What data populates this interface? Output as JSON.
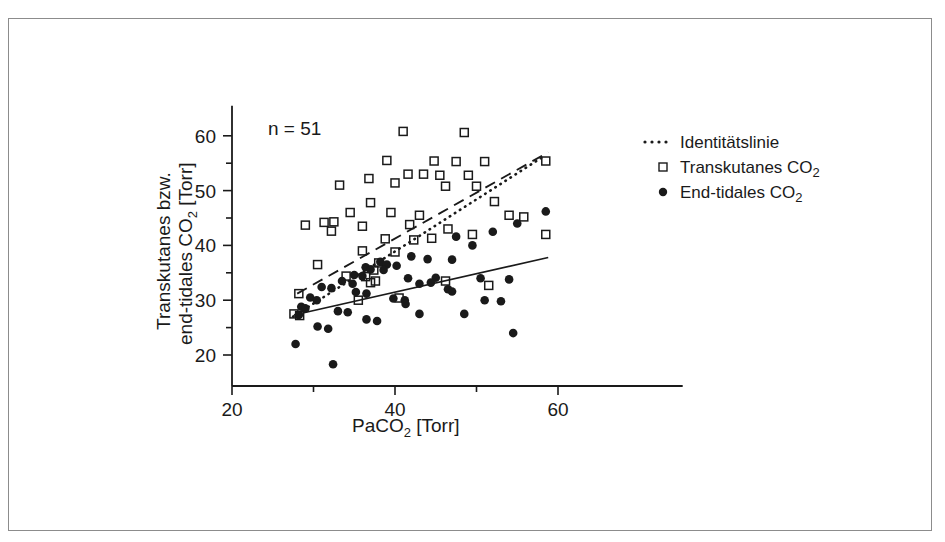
{
  "figure": {
    "frame_color": "#8c8c8c",
    "background": "#ffffff",
    "ink_color": "#1a1a1a"
  },
  "annotation": {
    "sample_size": "n = 51"
  },
  "axis_titles": {
    "x_main": "PaCO",
    "x_sub": "2",
    "x_unit": " [Torr]",
    "y_line1": "Transkutanes bzw.",
    "y_line2_main": "end-tidales CO",
    "y_line2_sub": "2",
    "y_line2_unit": " [Torr]"
  },
  "legend": {
    "items": [
      {
        "label": "Identitätslinie",
        "marker": "dotted-line-icon"
      },
      {
        "label_main": "Transkutanes CO",
        "label_sub": "2",
        "marker": "open-square-icon"
      },
      {
        "label_main": "End-tidales CO",
        "label_sub": "2",
        "marker": "filled-circle-icon"
      }
    ]
  },
  "chart_data": {
    "type": "scatter",
    "title": "",
    "xlabel": "PaCO2 [Torr]",
    "ylabel": "Transkutanes bzw. end-tidales CO2 [Torr]",
    "xlim": [
      20,
      75.3
    ],
    "ylim": [
      15.5,
      65.5
    ],
    "xticks": [
      20,
      30,
      40,
      50,
      60
    ],
    "xticklabels": [
      "20",
      "",
      "40",
      "",
      "60"
    ],
    "yticks": [
      20,
      25,
      30,
      35,
      40,
      45,
      50,
      55,
      60
    ],
    "yticklabels": [
      "20",
      "",
      "30",
      "",
      "40",
      "",
      "50",
      "",
      "60"
    ],
    "grid": false,
    "legend_position": "right",
    "annotations": [
      {
        "text": "n = 51",
        "x": 28.5,
        "y": 61.5
      }
    ],
    "series": [
      {
        "name": "Transkutanes CO2",
        "marker": "open-square",
        "points": [
          [
            41.0,
            60.8
          ],
          [
            48.5,
            60.6
          ],
          [
            39.0,
            55.5
          ],
          [
            44.8,
            55.4
          ],
          [
            47.5,
            55.3
          ],
          [
            51.0,
            55.3
          ],
          [
            58.5,
            55.4
          ],
          [
            36.8,
            52.2
          ],
          [
            41.6,
            53.0
          ],
          [
            43.5,
            53.0
          ],
          [
            45.5,
            52.8
          ],
          [
            49.0,
            52.8
          ],
          [
            33.2,
            51.0
          ],
          [
            40.0,
            51.4
          ],
          [
            46.2,
            50.8
          ],
          [
            50.0,
            50.8
          ],
          [
            37.0,
            47.8
          ],
          [
            52.2,
            48.0
          ],
          [
            34.5,
            46.0
          ],
          [
            39.5,
            46.0
          ],
          [
            43.0,
            45.5
          ],
          [
            54.0,
            45.5
          ],
          [
            55.8,
            45.2
          ],
          [
            29.0,
            43.7
          ],
          [
            31.3,
            44.2
          ],
          [
            32.5,
            44.3
          ],
          [
            36.0,
            43.5
          ],
          [
            41.8,
            43.8
          ],
          [
            32.2,
            42.6
          ],
          [
            46.5,
            43.0
          ],
          [
            49.5,
            42.0
          ],
          [
            58.5,
            42.0
          ],
          [
            38.8,
            41.2
          ],
          [
            42.3,
            41.0
          ],
          [
            44.5,
            41.3
          ],
          [
            36.0,
            39.0
          ],
          [
            40.0,
            38.8
          ],
          [
            30.5,
            36.5
          ],
          [
            38.0,
            36.8
          ],
          [
            37.4,
            35.5
          ],
          [
            34.0,
            34.4
          ],
          [
            36.4,
            34.3
          ],
          [
            37.0,
            33.2
          ],
          [
            37.6,
            33.5
          ],
          [
            46.2,
            33.5
          ],
          [
            51.5,
            32.7
          ],
          [
            28.2,
            31.2
          ],
          [
            27.6,
            27.5
          ],
          [
            28.3,
            27.2
          ],
          [
            35.5,
            30.0
          ],
          [
            40.5,
            30.4
          ]
        ]
      },
      {
        "name": "End-tidales CO2",
        "marker": "filled-circle",
        "points": [
          [
            58.5,
            46.2
          ],
          [
            55.0,
            44.0
          ],
          [
            52.0,
            42.5
          ],
          [
            47.5,
            41.6
          ],
          [
            49.5,
            40.0
          ],
          [
            42.0,
            38.0
          ],
          [
            44.0,
            37.5
          ],
          [
            47.0,
            37.4
          ],
          [
            38.2,
            37.0
          ],
          [
            39.0,
            36.5
          ],
          [
            40.2,
            36.3
          ],
          [
            36.4,
            36.0
          ],
          [
            37.0,
            35.6
          ],
          [
            38.6,
            35.5
          ],
          [
            35.0,
            34.6
          ],
          [
            36.0,
            34.4
          ],
          [
            41.6,
            34.0
          ],
          [
            45.0,
            34.1
          ],
          [
            50.5,
            34.0
          ],
          [
            54.0,
            33.8
          ],
          [
            33.5,
            33.5
          ],
          [
            34.8,
            33.0
          ],
          [
            43.0,
            33.0
          ],
          [
            44.4,
            33.2
          ],
          [
            31.0,
            32.4
          ],
          [
            32.2,
            32.2
          ],
          [
            46.5,
            32.0
          ],
          [
            47.0,
            31.6
          ],
          [
            35.2,
            31.5
          ],
          [
            36.5,
            31.2
          ],
          [
            29.6,
            30.5
          ],
          [
            30.4,
            30.0
          ],
          [
            39.8,
            30.3
          ],
          [
            41.2,
            30.0
          ],
          [
            41.3,
            29.3
          ],
          [
            51.0,
            30.0
          ],
          [
            53.0,
            29.8
          ],
          [
            28.5,
            28.8
          ],
          [
            29.0,
            28.5
          ],
          [
            28.2,
            27.3
          ],
          [
            33.0,
            28.0
          ],
          [
            34.2,
            27.8
          ],
          [
            43.0,
            27.5
          ],
          [
            48.5,
            27.5
          ],
          [
            36.5,
            26.5
          ],
          [
            37.8,
            26.2
          ],
          [
            30.5,
            25.2
          ],
          [
            31.8,
            24.8
          ],
          [
            54.5,
            24.0
          ],
          [
            27.8,
            22.0
          ],
          [
            32.4,
            18.3
          ]
        ]
      }
    ],
    "lines": [
      {
        "name": "Identitätslinie",
        "style": "dotted",
        "x": [
          27.5,
          58.2
        ],
        "y": [
          27.0,
          56.2
        ]
      },
      {
        "name": "Transkutane Regressionsgerade",
        "style": "dashed",
        "x": [
          28.0,
          58.8
        ],
        "y": [
          31.2,
          57.0
        ]
      },
      {
        "name": "End-tidale Regressionsgerade",
        "style": "solid",
        "x": [
          27.6,
          58.8
        ],
        "y": [
          27.3,
          37.8
        ]
      }
    ]
  }
}
